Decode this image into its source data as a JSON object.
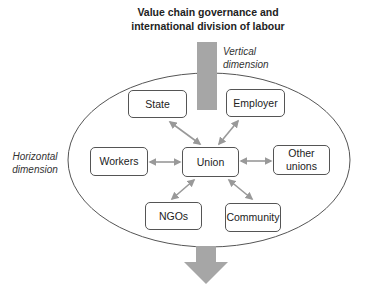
{
  "title": {
    "line1": "Value chain governance and",
    "line2": "international division of labour"
  },
  "labels": {
    "vertical_line1": "Vertical",
    "vertical_line2": "dimension",
    "horizontal_line1": "Horizontal",
    "horizontal_line2": "dimension"
  },
  "nodes": {
    "state": "State",
    "employer": "Employer",
    "workers": "Workers",
    "union": "Union",
    "other_unions_line1": "Other",
    "other_unions_line2": "unions",
    "ngos": "NGOs",
    "community": "Community"
  },
  "colors": {
    "arrow_fill": "#a6a6a6",
    "connector": "#999999",
    "outline": "#555555"
  }
}
